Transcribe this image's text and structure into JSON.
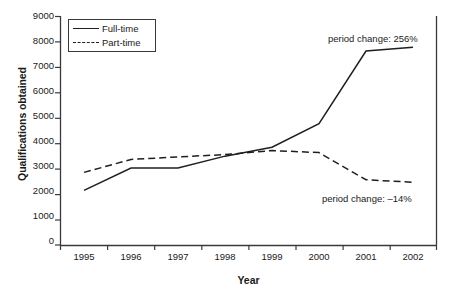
{
  "chart_data": {
    "type": "line",
    "title": "",
    "xlabel": "Year",
    "ylabel": "Qualifications obtained",
    "categories": [
      "1995",
      "1996",
      "1997",
      "1998",
      "1999",
      "2000",
      "2001",
      "2002"
    ],
    "x": [
      1995,
      1996,
      1997,
      1998,
      1999,
      2000,
      2001,
      2002
    ],
    "series": [
      {
        "name": "Full-time",
        "style": "solid",
        "values": [
          2150,
          3030,
          3030,
          3500,
          3850,
          4780,
          7640,
          7790
        ]
      },
      {
        "name": "Part-time",
        "style": "dashed",
        "values": [
          2860,
          3370,
          3470,
          3560,
          3720,
          3640,
          2570,
          2470
        ]
      }
    ],
    "ylim": [
      0,
      9000
    ],
    "yticks": [
      0,
      1000,
      2000,
      3000,
      4000,
      5000,
      6000,
      7000,
      8000,
      9000
    ],
    "ytick_labels": [
      "0",
      "1000",
      "2000",
      "3000",
      "4000",
      "5000",
      "6000",
      "7000",
      "8000",
      "9000"
    ],
    "grid": false,
    "legend_position": "top-left",
    "annotations": [
      {
        "id": "fulltime",
        "text": "period change: 256%"
      },
      {
        "id": "parttime",
        "text": "period change: –14%"
      }
    ],
    "colors": {
      "line": "#1f1f1f",
      "axis": "#3a3a3a",
      "background": "#ffffff",
      "text": "#1a1a1a"
    }
  },
  "legend": {
    "items": [
      {
        "label": "Full-time"
      },
      {
        "label": "Part-time"
      }
    ]
  },
  "axes": {
    "y_title": "Qualifications obtained",
    "x_title": "Year"
  }
}
